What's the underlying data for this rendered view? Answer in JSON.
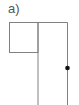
{
  "figure": {
    "label": "a)",
    "line_color": "#808080",
    "dot_color": "#111111",
    "shapes": {
      "top_line": {
        "x1": 9.5,
        "y1": 22.5,
        "x2": 67.5,
        "y2": 22.5
      },
      "box": {
        "x": 9.5,
        "y": 22.5,
        "width": 28.5,
        "height": 30
      },
      "middle_vertical": {
        "x1": 38,
        "y1": 22.5,
        "x2": 38,
        "y2": 105
      },
      "right_vertical": {
        "x1": 67.5,
        "y1": 22.5,
        "x2": 67.5,
        "y2": 105
      },
      "dot": {
        "cx": 67.5,
        "cy": 68,
        "r": 2.3
      }
    }
  }
}
